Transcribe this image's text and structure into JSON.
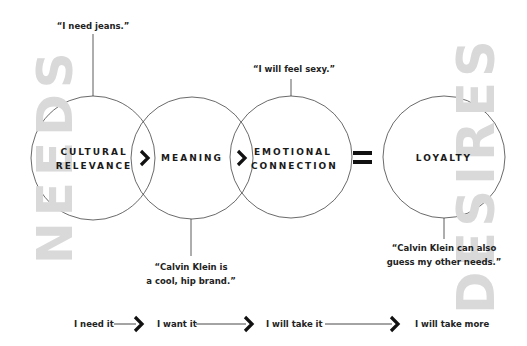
{
  "side_words": {
    "left": "NEEDS",
    "right": "DESIRES",
    "color": "#d9d9d9"
  },
  "circles": [
    {
      "id": "cultural-relevance",
      "line1": "CULTURAL",
      "line2": "RELEVANCE"
    },
    {
      "id": "meaning",
      "line1": "MEANING"
    },
    {
      "id": "emotional-connection",
      "line1": "EMOTIONAL",
      "line2": "CONNECTION"
    },
    {
      "id": "loyalty",
      "line1": "LOYALTY"
    }
  ],
  "quotes": {
    "cultural_relevance": "“I need jeans.”",
    "meaning": [
      "“Calvin Klein is",
      "a cool, hip brand.”"
    ],
    "emotional_connection": "“I will feel sexy.”",
    "loyalty": [
      "“Calvin Klein can also",
      "guess my other needs.”"
    ]
  },
  "operators": {
    "equals": "="
  },
  "progression": [
    {
      "label": "I need it"
    },
    {
      "label": "I want it"
    },
    {
      "label": "I will take it"
    },
    {
      "label": "I will take more"
    }
  ]
}
